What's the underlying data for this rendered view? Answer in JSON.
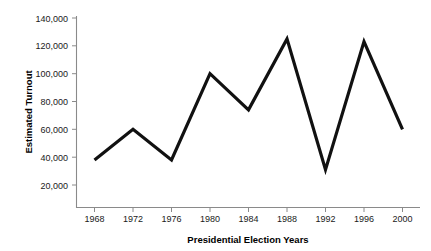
{
  "chart_data": {
    "type": "line",
    "title": "",
    "subtitle": "",
    "xlabel": "Presidential Election Years",
    "ylabel": "Estimated Turnout",
    "categories": [
      "1968",
      "1972",
      "1976",
      "1980",
      "1984",
      "1988",
      "1992",
      "1996",
      "2000"
    ],
    "x": [
      1968,
      1972,
      1976,
      1980,
      1984,
      1988,
      1992,
      1996,
      2000
    ],
    "values": [
      38000,
      60000,
      38000,
      100000,
      74000,
      125000,
      31000,
      123000,
      60000
    ],
    "series": [
      {
        "name": "Estimated Turnout",
        "values": [
          38000,
          60000,
          38000,
          100000,
          74000,
          125000,
          31000,
          123000,
          60000
        ]
      }
    ],
    "ylim": [
      0,
      140000
    ],
    "xlim": [
      1966,
      2002
    ],
    "yticks": [
      20000,
      40000,
      60000,
      80000,
      100000,
      120000,
      140000
    ],
    "ytick_labels": [
      "20,000",
      "40,000",
      "60,000",
      "80,000",
      "100,000",
      "120,000",
      "140,000"
    ],
    "xticks": [
      1968,
      1972,
      1976,
      1980,
      1984,
      1988,
      1992,
      1996,
      2000
    ],
    "xtick_labels": [
      "1968",
      "1972",
      "1976",
      "1980",
      "1984",
      "1988",
      "1992",
      "1996",
      "2000"
    ],
    "grid": false,
    "legend": false,
    "legend_position": "none",
    "line_color": "#111111",
    "axis_color": "#8a8a8a",
    "background_color": "#ffffff",
    "annotations": []
  },
  "axes": {
    "y_axis_title": "Estimated Turnout",
    "x_axis_title": "Presidential Election Years",
    "y_tick_labels": [
      "140,000",
      "120,000",
      "100,000",
      "80,000",
      "60,000",
      "40,000",
      "20,000"
    ],
    "x_tick_labels": [
      "1968",
      "1972",
      "1976",
      "1980",
      "1984",
      "1988",
      "1992",
      "1996",
      "2000"
    ]
  }
}
